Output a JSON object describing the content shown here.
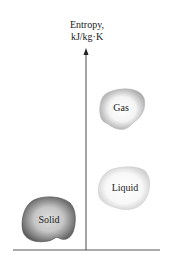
{
  "diagram": {
    "axis": {
      "label_line1": "Entropy,",
      "label_line2": "kJ/kg·K"
    },
    "phases": [
      {
        "name": "Gas",
        "fill": "#d8d8d8",
        "edge": "#a8a8a8"
      },
      {
        "name": "Liquid",
        "fill": "#ececec",
        "edge": "#c0c0c0"
      },
      {
        "name": "Solid",
        "fill": "#b4b4b4",
        "edge": "#6e6e6e"
      }
    ]
  }
}
